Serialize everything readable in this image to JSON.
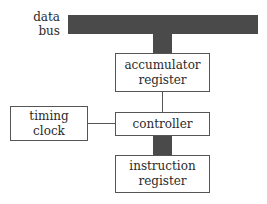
{
  "diagram": {
    "bus_label": [
      "data",
      "bus"
    ],
    "nodes": {
      "accumulator": [
        "accumulator",
        "register"
      ],
      "timing": [
        "timing",
        "clock"
      ],
      "controller": [
        "controller"
      ],
      "instruction": [
        "instruction",
        "register"
      ]
    },
    "colors": {
      "bus": "#4a4a4a",
      "border": "#555555"
    }
  }
}
